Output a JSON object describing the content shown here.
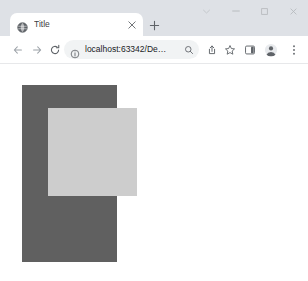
{
  "window": {
    "controls": [
      {
        "name": "tab-search",
        "glyph": "⌄"
      },
      {
        "name": "minimize",
        "glyph": "‒"
      },
      {
        "name": "maximize",
        "glyph": "□"
      },
      {
        "name": "close",
        "glyph": "✕"
      }
    ]
  },
  "tabstrip": {
    "tabs": [
      {
        "title": "Title",
        "favicon": "globe-icon",
        "close_glyph": "✕",
        "active": true
      }
    ],
    "new_tab_label": "+",
    "new_tab_tooltip": "New tab"
  },
  "toolbar": {
    "back_label": "←",
    "forward_label": "→",
    "reload_label": "C",
    "omnibox": {
      "url": "localhost:63342/De…",
      "placeholder": "Search Google or type a URL",
      "info_icon": "info-icon",
      "zoom_icon": "search-icon"
    },
    "actions": [
      {
        "name": "share-icon"
      },
      {
        "name": "bookmark-star-icon"
      },
      {
        "name": "side-panel-icon"
      },
      {
        "name": "profile-avatar-icon"
      },
      {
        "name": "more-menu-icon"
      }
    ]
  },
  "page": {
    "background": "#ffffff",
    "shapes": [
      {
        "name": "dark-rectangle",
        "color": "#606060",
        "x": 22,
        "y": 20,
        "width": 95,
        "height": 177
      },
      {
        "name": "light-square",
        "color": "#cdcdcd",
        "x": 48,
        "y": 43,
        "width": 89,
        "height": 88
      }
    ]
  }
}
